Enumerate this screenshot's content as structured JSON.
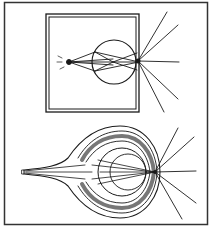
{
  "figure": {
    "colors": {
      "ink": "#1a1a1a",
      "paper": "#ffffff",
      "frame": "#333333"
    },
    "panels": [
      {
        "name": "camera-obscura",
        "label": ""
      },
      {
        "name": "eye-cross-section",
        "label": ""
      }
    ]
  }
}
